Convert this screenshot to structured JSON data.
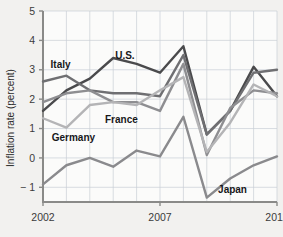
{
  "chart_data": {
    "type": "line",
    "title": "",
    "xlabel": "",
    "ylabel": "Inflation rate (percent)",
    "xlim": [
      2002,
      2012
    ],
    "ylim": [
      -1.5,
      5
    ],
    "yticks": [
      -1,
      0,
      1,
      2,
      3,
      4,
      5
    ],
    "ytick_labels": [
      "− 1",
      "0",
      "1",
      "2",
      "3",
      "4",
      "5"
    ],
    "xticks": [
      2002,
      2007,
      2012
    ],
    "xtick_labels": [
      "2002",
      "2007",
      "2012"
    ],
    "x_gridlines": [
      2002,
      2003,
      2004,
      2005,
      2006,
      2007,
      2008,
      2009,
      2010,
      2011,
      2012
    ],
    "grid": true,
    "legend_position": "inline-annotations",
    "x": [
      2002,
      2003,
      2004,
      2005,
      2006,
      2007,
      2008,
      2009,
      2010,
      2011,
      2012
    ],
    "series": [
      {
        "name": "U.S.",
        "color": "#4a4a4c",
        "values": [
          1.6,
          2.3,
          2.7,
          3.4,
          3.2,
          2.9,
          3.8,
          0.8,
          1.6,
          3.1,
          2.1
        ]
      },
      {
        "name": "Italy",
        "color": "#6f6f72",
        "values": [
          2.6,
          2.8,
          2.3,
          2.2,
          2.2,
          2.1,
          3.5,
          0.8,
          1.6,
          2.9,
          3.0
        ]
      },
      {
        "name": "France",
        "color": "#8e8e91",
        "values": [
          1.9,
          2.2,
          2.3,
          1.9,
          1.9,
          1.6,
          3.2,
          0.1,
          1.7,
          2.3,
          2.2
        ]
      },
      {
        "name": "Germany",
        "color": "#b4b4b6",
        "values": [
          1.35,
          1.03,
          1.8,
          1.9,
          1.8,
          2.3,
          2.75,
          0.2,
          1.2,
          2.5,
          2.1
        ]
      },
      {
        "name": "Japan",
        "color": "#8a8a8d",
        "values": [
          -0.9,
          -0.25,
          0.0,
          -0.3,
          0.25,
          0.05,
          1.4,
          -1.35,
          -0.7,
          -0.25,
          0.05
        ]
      }
    ],
    "annotations": [
      {
        "text": "Italy",
        "x": 2002.75,
        "y": 3.05
      },
      {
        "text": "U.S.",
        "x": 2005.5,
        "y": 3.35
      },
      {
        "text": "France",
        "x": 2005.35,
        "y": 1.2
      },
      {
        "text": "Germany",
        "x": 2003.3,
        "y": 0.58
      },
      {
        "text": "Japan",
        "x": 2010.1,
        "y": -1.18
      }
    ]
  },
  "colors": {
    "background": "#f2f1ef",
    "plot_background": "#fbfbfa",
    "grid": "#c9cfd6",
    "axis": "#8a8a88",
    "text": "#2b2b2b"
  }
}
